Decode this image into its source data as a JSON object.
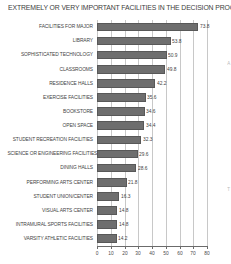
{
  "chart_data": {
    "type": "bar",
    "orientation": "horizontal",
    "title": "EXTREMELY OR VERY IMPORTANT FACILITIES IN THE DECISION PROCESS",
    "xlabel": "",
    "ylabel": "",
    "xlim": [
      0,
      80
    ],
    "grid": true,
    "legend": false,
    "bar_color": "#6e6e6e",
    "xticks": [
      "0",
      "10",
      "20",
      "30",
      "40",
      "50",
      "60",
      "70",
      "80"
    ],
    "categories": [
      "FACILITIES FOR MAJOR",
      "LIBRARY",
      "SOPHISTICATED TECHNOLOGY",
      "CLASSROOMS",
      "RESIDENCE HALLS",
      "EXERCISE FACILITIES",
      "BOOKSTORE",
      "OPEN SPACE",
      "STUDENT RECREATION FACILITIES",
      "SCIENCE OR ENGINEERING FACILITIES",
      "DINING HALLS",
      "PERFORMING ARTS CENTER",
      "STUDENT UNION/CENTER",
      "VISUAL ARTS CENTER",
      "INTRAMURAL SPORTS FACILITIES",
      "VARSITY ATHLETIC FACILITIES"
    ],
    "values": [
      73.8,
      53.8,
      50.9,
      49.8,
      42.2,
      35.6,
      34.6,
      34.4,
      32.3,
      29.6,
      28.6,
      21.8,
      16.3,
      14.8,
      14.8,
      14.2
    ],
    "value_labels": [
      "73.8",
      "53.8",
      "50.9",
      "49.8",
      "42.2",
      "35.6",
      "34.6",
      "34.4",
      "32.3",
      "29.6",
      "28.6",
      "21.8",
      "16.3",
      "14.8",
      "14.8",
      "14.2"
    ]
  },
  "edge_marks": [
    "A",
    "T"
  ]
}
